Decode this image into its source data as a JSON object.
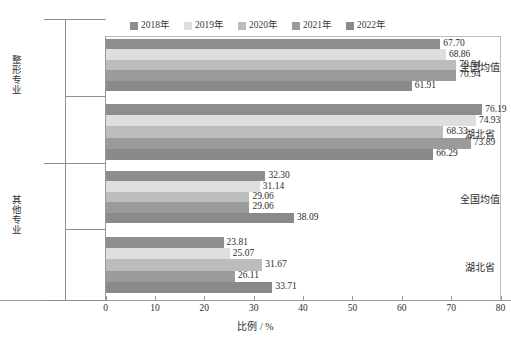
{
  "chart_data": {
    "type": "bar",
    "orientation": "horizontal",
    "title": "",
    "xlabel": "比例 / %",
    "ylabel": "",
    "xlim": [
      0,
      80
    ],
    "xticks": [
      0,
      10,
      20,
      30,
      40,
      50,
      60,
      70,
      80
    ],
    "xtick_labels": [
      "0",
      "10",
      "20",
      "30",
      "40",
      "50",
      "60",
      "70",
      "80"
    ],
    "grid": false,
    "legend_position": "top-center",
    "legend": [
      "2018年",
      "2019年",
      "2020年",
      "2021年",
      "2022年"
    ],
    "series": [
      {
        "name": "2018年",
        "color": "#8d8d8d",
        "values": [
          67.7,
          76.19,
          32.3,
          23.81
        ]
      },
      {
        "name": "2019年",
        "color": "#dedede",
        "values": [
          68.86,
          74.93,
          31.14,
          25.07
        ]
      },
      {
        "name": "2020年",
        "color": "#bcbcbc",
        "values": [
          70.94,
          68.33,
          29.06,
          31.67
        ]
      },
      {
        "name": "2021年",
        "color": "#9b9b9b",
        "values": [
          70.94,
          73.89,
          29.06,
          26.11
        ]
      },
      {
        "name": "2022年",
        "color": "#8a8a8a",
        "values": [
          61.91,
          66.29,
          38.09,
          33.71
        ]
      }
    ],
    "categories": [
      "全国均值",
      "湖北省",
      "全国均值",
      "湖北省"
    ],
    "outer_categories": [
      "整形专业",
      "其他专业"
    ],
    "groups": [
      {
        "outer": "整形专业",
        "inner": "全国均值",
        "bars": [
          {
            "series": "2018年",
            "value": 67.7,
            "label": "67.70"
          },
          {
            "series": "2019年",
            "value": 68.86,
            "label": "68.86"
          },
          {
            "series": "2020年",
            "value": 70.94,
            "label": "70.94"
          },
          {
            "series": "2021年",
            "value": 70.94,
            "label": "70.94"
          },
          {
            "series": "2022年",
            "value": 61.91,
            "label": "61.91"
          }
        ]
      },
      {
        "outer": "整形专业",
        "inner": "湖北省",
        "bars": [
          {
            "series": "2018年",
            "value": 76.19,
            "label": "76.19"
          },
          {
            "series": "2019年",
            "value": 74.93,
            "label": "74.93"
          },
          {
            "series": "2020年",
            "value": 68.33,
            "label": "68.33"
          },
          {
            "series": "2021年",
            "value": 73.89,
            "label": "73.89"
          },
          {
            "series": "2022年",
            "value": 66.29,
            "label": "66.29"
          }
        ]
      },
      {
        "outer": "其他专业",
        "inner": "全国均值",
        "bars": [
          {
            "series": "2018年",
            "value": 32.3,
            "label": "32.30"
          },
          {
            "series": "2019年",
            "value": 31.14,
            "label": "31.14"
          },
          {
            "series": "2020年",
            "value": 29.06,
            "label": "29.06"
          },
          {
            "series": "2021年",
            "value": 29.06,
            "label": "29.06"
          },
          {
            "series": "2022年",
            "value": 38.09,
            "label": "38.09"
          }
        ]
      },
      {
        "outer": "其他专业",
        "inner": "湖北省",
        "bars": [
          {
            "series": "2018年",
            "value": 23.81,
            "label": "23.81"
          },
          {
            "series": "2019年",
            "value": 25.07,
            "label": "25.07"
          },
          {
            "series": "2020年",
            "value": 31.67,
            "label": "31.67"
          },
          {
            "series": "2021年",
            "value": 26.11,
            "label": "26.11"
          },
          {
            "series": "2022年",
            "value": 33.71,
            "label": "33.71"
          }
        ]
      }
    ]
  },
  "colors": {
    "axis": "#9a9a9a",
    "frame": "#bdbdbd",
    "text": "#2d2d2d",
    "background": "#ffffff"
  }
}
